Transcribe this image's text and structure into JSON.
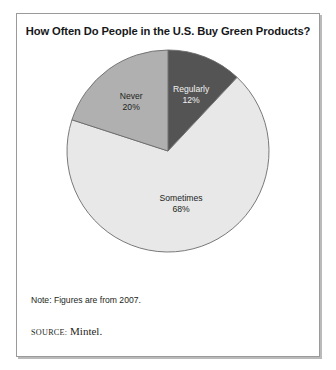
{
  "figure": {
    "title": "How Often Do People in the U.S. Buy Green Products?",
    "note": "Note: Figures are from 2007.",
    "source_kicker": "source:",
    "source_value": "Mintel."
  },
  "colors": {
    "slice_regularly": "#545454",
    "slice_never": "#b0b0b0",
    "slice_sometimes": "#e8e8e8",
    "slice_outline": "#6b6b6b",
    "frame_border": "#9a9a9a",
    "text_dark": "#1d1f21",
    "text_light": "#f2f2f2",
    "background": "#ffffff"
  },
  "chart_data": {
    "type": "pie",
    "title": "How Often Do People in the U.S. Buy Green Products?",
    "categories": [
      "Regularly",
      "Sometimes",
      "Never"
    ],
    "values": [
      12,
      68,
      20
    ],
    "value_labels": [
      "12%",
      "68%",
      "20%"
    ],
    "unit": "percent",
    "start_angle_deg": 0,
    "direction": "clockwise",
    "legend": "none",
    "labels_inside_slices": true,
    "slices": [
      {
        "label": "Regularly",
        "value": 12,
        "value_label": "12%",
        "color": "#545454",
        "text_color": "#f2f2f2"
      },
      {
        "label": "Sometimes",
        "value": 68,
        "value_label": "68%",
        "color": "#e8e8e8",
        "text_color": "#1d1f21"
      },
      {
        "label": "Never",
        "value": 20,
        "value_label": "20%",
        "color": "#b0b0b0",
        "text_color": "#1d1f21"
      }
    ],
    "note": "Note: Figures are from 2007.",
    "source": "Mintel."
  }
}
